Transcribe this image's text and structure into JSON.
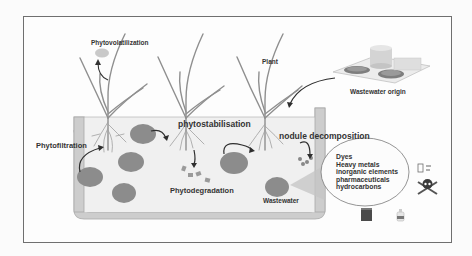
{
  "diagram": {
    "type": "phytoremediation-process-diagram",
    "labels": {
      "phytovolatilization": "Phytovolatilization",
      "plant": "Plant",
      "wastewater_origin": "Wastewater origin",
      "phytofiltration": "Phytofiltration",
      "phytostabilisation": "phytostabilisation",
      "nodule_decomposition": "nodule decomposition",
      "phytodegradation": "Phytodegradation",
      "wastewater": "Wastewater"
    },
    "pollutants": [
      "Dyes",
      "Heavy metals",
      " inorganic elements",
      "pharmaceuticals",
      "hydrocarbons"
    ],
    "icons": [
      "plant-icon",
      "wastewater-plant-icon",
      "pollutant-particle-icon",
      "skull-crossbones-icon",
      "barrel-icon",
      "bottle-icon",
      "battery-icon"
    ],
    "colors": {
      "frame": "#6f6f6f",
      "tank_wall": "#c8c8c8",
      "water": "#f1f1f1",
      "particle": "#8a8a8a",
      "plant": "#8c8c8c",
      "arrow": "#2e2e2e"
    }
  }
}
